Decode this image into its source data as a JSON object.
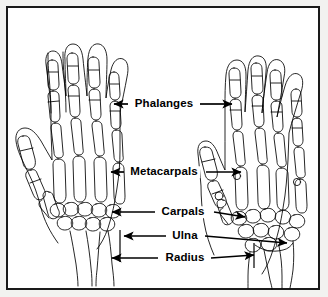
{
  "figure": {
    "kind": "anatomical-diagram",
    "view_count": 2,
    "views": [
      "left-hand-skeleton",
      "right-hand-skeleton"
    ],
    "background_color": "#ffffff",
    "frame_color": "#1a1a1a",
    "line_color": "#000000",
    "text_color": "#000000"
  },
  "labels": [
    {
      "id": "phalanges",
      "text": "Phalanges",
      "center_x": 164,
      "center_y": 104,
      "left_arrow_tip_x": 114,
      "left_arrow_tip_y": 104,
      "left_line_start_x": 128,
      "right_arrow_tip_x": 232,
      "right_arrow_tip_y": 104,
      "right_line_start_x": 200
    },
    {
      "id": "metacarpals",
      "text": "Metacarpals",
      "center_x": 164,
      "center_y": 172,
      "left_arrow_tip_x": 111,
      "left_arrow_tip_y": 172,
      "left_line_start_x": 124,
      "right_arrow_tip_x": 241,
      "right_arrow_tip_y": 172,
      "right_line_start_x": 206
    },
    {
      "id": "carpals",
      "text": "Carpals",
      "center_x": 183,
      "center_y": 212,
      "left_arrow_tip_x": 112,
      "left_arrow_tip_y": 212,
      "left_line_start_x": 155,
      "right_arrow_tip_x": 245,
      "right_arrow_tip_y": 217,
      "right_line_start_x": 214
    },
    {
      "id": "ulna",
      "text": "Ulna",
      "center_x": 185,
      "center_y": 236,
      "left_arrow_tip_x": 124,
      "left_arrow_tip_y": 236,
      "left_line_start_x": 166,
      "right_arrow_tip_x": 287,
      "right_arrow_tip_y": 243,
      "right_line_start_x": 205
    },
    {
      "id": "radius",
      "text": "Radius",
      "center_x": 185,
      "center_y": 258,
      "left_arrow_tip_x": 112,
      "left_arrow_tip_y": 258,
      "left_line_start_x": 158,
      "right_arrow_tip_x": 254,
      "right_arrow_tip_y": 255,
      "right_line_start_x": 211
    }
  ]
}
